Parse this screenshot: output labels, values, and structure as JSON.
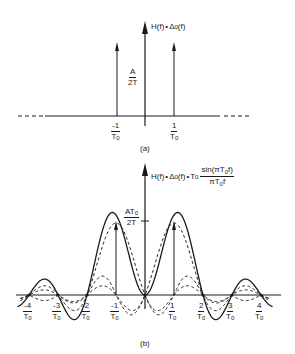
{
  "figure": {
    "panel_a": {
      "title_prefix": "H(f)",
      "title_op": "•",
      "title_delta": "Δ",
      "title_delta_sub": "0",
      "title_suffix": "(f)",
      "amplitude_label_num": "A",
      "amplitude_label_den": "2T",
      "tick_neg": {
        "num": "-1",
        "den": "T",
        "den_sub": "0"
      },
      "tick_pos": {
        "num": "1",
        "den": "T",
        "den_sub": "0"
      },
      "caption": "(a)"
    },
    "panel_b": {
      "title_prefix": "H(f)",
      "title_op1": "•",
      "title_delta": "Δ",
      "title_delta_sub": "0",
      "title_mid": "(f)",
      "title_op2": "•",
      "title_T": "T",
      "title_T_sub": "0",
      "title_frac_num": "sin(πT",
      "title_frac_num_sub": "0",
      "title_frac_num_tail": "f)",
      "title_frac_den": "πT",
      "title_frac_den_sub": "0",
      "title_frac_den_tail": "f",
      "amplitude_label_num": "AT",
      "amplitude_label_num_sub": "0",
      "amplitude_label_den": "2T",
      "ticks": [
        {
          "num": "-4",
          "den": "T",
          "sub": "0"
        },
        {
          "num": "-3",
          "den": "T",
          "sub": "0"
        },
        {
          "num": "-2",
          "den": "T",
          "sub": "0"
        },
        {
          "num": "-1",
          "den": "T",
          "sub": "0"
        },
        {
          "num": "1",
          "den": "T",
          "sub": "0"
        },
        {
          "num": "2",
          "den": "T",
          "sub": "0"
        },
        {
          "num": "3",
          "den": "T",
          "sub": "0"
        },
        {
          "num": "4",
          "den": "T",
          "sub": "0"
        }
      ],
      "caption": "(b)"
    }
  },
  "chart_data": {
    "type": "line",
    "xlabel": "f (multiples of 1/T0)",
    "ylabel": "",
    "x_ticks": [
      -4,
      -3,
      -2,
      -1,
      1,
      2,
      3,
      4
    ],
    "impulses_a": [
      {
        "x": -1,
        "height": "A/2T"
      },
      {
        "x": 1,
        "height": "A/2T"
      }
    ],
    "series": [
      {
        "name": "sum of sincs (solid)",
        "style": "solid",
        "description": "sinc centered at -1/T0 plus sinc centered at +1/T0, peak AT0/2T"
      },
      {
        "name": "sinc at +1/T0 (dashed)",
        "style": "dashed"
      },
      {
        "name": "sinc at -1/T0 (dashed)",
        "style": "dashed"
      }
    ],
    "peak_label": "AT0/2T",
    "xlim": [
      -4.5,
      4.5
    ]
  }
}
